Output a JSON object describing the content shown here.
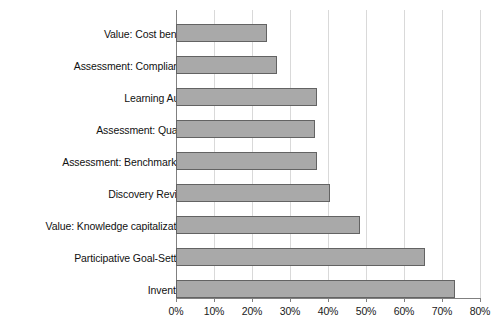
{
  "chart_data": {
    "type": "bar",
    "orientation": "horizontal",
    "title": "",
    "subtitle": "",
    "xlabel": "",
    "ylabel": "",
    "xlim": [
      0,
      80
    ],
    "xtick_labels": [
      "0%",
      "10%",
      "20%",
      "30%",
      "40%",
      "50%",
      "60%",
      "70%",
      "80%"
    ],
    "xtick_values": [
      0,
      10,
      20,
      30,
      40,
      50,
      60,
      70,
      80
    ],
    "grid": true,
    "legend": false,
    "legend_position": "none",
    "bar_fill_color": "#a9a9a9",
    "bar_border_color": "#636363",
    "gridline_color": "#d9d9d9",
    "axis_color": "#808080",
    "categories": [
      "Value: Cost benefit",
      "Assessment: Compliance",
      "Learning Audit",
      "Assessment: Quality",
      "Assessment: Benchmarking",
      "Discovery Review",
      "Value: Knowledge capitalization",
      "Participative Goal-Setting",
      "Inventory"
    ],
    "values": [
      24,
      26.5,
      37,
      36.5,
      37,
      40.5,
      48.5,
      65.5,
      73.5
    ],
    "series": [
      {
        "name": "",
        "values": [
          24,
          26.5,
          37,
          36.5,
          37,
          40.5,
          48.5,
          65.5,
          73.5
        ]
      }
    ]
  }
}
